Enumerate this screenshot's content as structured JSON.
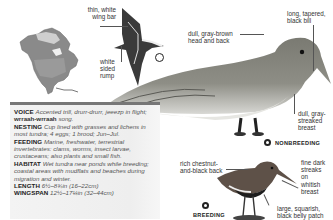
{
  "page": {
    "species_type": "shorebird field guide entry"
  },
  "map": {
    "icon": "north-america-range-map"
  },
  "flight_illustration": {
    "callouts": [
      {
        "id": "wing-bar",
        "text_line1": "thin, white",
        "text_line2": "wing bar"
      },
      {
        "id": "rump",
        "text_line1": "white",
        "text_line2": "sided",
        "text_line3": "rump"
      }
    ]
  },
  "nonbreeding": {
    "label": "NONBREEDING",
    "callouts": [
      {
        "id": "head",
        "text_line1": "dull, gray-brown",
        "text_line2": "head and back"
      },
      {
        "id": "bill",
        "text_line1": "long, tapered,",
        "text_line2": "black bill"
      },
      {
        "id": "breast",
        "text_line1": "dull, gray-",
        "text_line2": "streaked",
        "text_line3": "breast"
      }
    ]
  },
  "breeding": {
    "label": "BREEDING",
    "callouts": [
      {
        "id": "back",
        "text_line1": "rich chestnut-",
        "text_line2": "and-black back"
      },
      {
        "id": "streaks",
        "text_line1": "fine dark",
        "text_line2": "streaks",
        "text_line3": "on",
        "text_line4": "whitish",
        "text_line5": "breast"
      },
      {
        "id": "belly",
        "text_line1": "large, squarish,",
        "text_line2": "black belly patch"
      }
    ]
  },
  "info": {
    "voice": {
      "key": "VOICE",
      "value_1": "Accented trill, drurr-drurr,",
      "value_2": "jeeezp in flight;",
      "value_bold": "wrraah-wrraah",
      "value_3": "song."
    },
    "nesting": {
      "key": "NESTING",
      "value": "Cup lined with grasses and lichens in most tundra; 4 eggs; 1 brood; Jun–Jul."
    },
    "feeding": {
      "key": "FEEDING",
      "value": "Marine, freshwater, terrestrial invertebrates: clams, worms, insect larvae, crustaceans; also plants and small fish."
    },
    "habitat": {
      "key": "HABITAT",
      "value": "Wet tundra near ponds while breeding; coastal areas with mudflats and beaches during migration and winter."
    },
    "length": {
      "key": "LENGTH",
      "value": "6½–8¾in (16–22cm)"
    },
    "wingspan": {
      "key": "WINGSPAN",
      "value": "12½–17¼in (32–44cm)"
    }
  },
  "colors": {
    "box_border": "#777777",
    "box_bg": "#f0f0f0",
    "text_key": "#222222",
    "text_value": "#555555"
  }
}
